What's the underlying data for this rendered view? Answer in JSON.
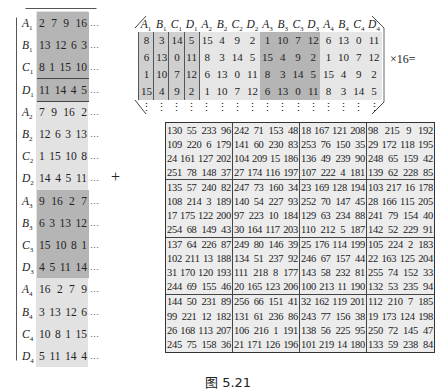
{
  "left_matrix": {
    "rows": [
      {
        "label": "A",
        "sub": "1",
        "values": [
          "2",
          "7",
          "9",
          "16"
        ],
        "dots": "…",
        "shade": "dark",
        "sep": true
      },
      {
        "label": "B",
        "sub": "1",
        "values": [
          "13",
          "12",
          "6",
          "3"
        ],
        "dots": "…",
        "shade": "dark",
        "sep": true
      },
      {
        "label": "C",
        "sub": "1",
        "values": [
          "8",
          "1",
          "15",
          "10"
        ],
        "dots": "…",
        "shade": "dark",
        "sep": true
      },
      {
        "label": "D",
        "sub": "1",
        "values": [
          "11",
          "14",
          "4",
          "5"
        ],
        "dots": "…",
        "shade": "dark",
        "sep": true
      },
      {
        "label": "A",
        "sub": "2",
        "values": [
          "7",
          "9",
          "16",
          "2"
        ],
        "dots": "…",
        "shade": "light",
        "sep": false
      },
      {
        "label": "B",
        "sub": "2",
        "values": [
          "12",
          "6",
          "3",
          "13"
        ],
        "dots": "…",
        "shade": "light",
        "sep": false
      },
      {
        "label": "C",
        "sub": "2",
        "values": [
          "1",
          "15",
          "10",
          "8"
        ],
        "dots": "…",
        "shade": "light",
        "sep": false
      },
      {
        "label": "D",
        "sub": "2",
        "values": [
          "14",
          "4",
          "5",
          "11"
        ],
        "dots": "…",
        "shade": "light",
        "sep": false
      },
      {
        "label": "A",
        "sub": "3",
        "values": [
          "9",
          "16",
          "2",
          "7"
        ],
        "dots": "…",
        "shade": "dark",
        "sep": false
      },
      {
        "label": "B",
        "sub": "3",
        "values": [
          "6",
          "3",
          "13",
          "12"
        ],
        "dots": "…",
        "shade": "dark",
        "sep": false
      },
      {
        "label": "C",
        "sub": "3",
        "values": [
          "15",
          "10",
          "8",
          "1"
        ],
        "dots": "…",
        "shade": "dark",
        "sep": false
      },
      {
        "label": "D",
        "sub": "3",
        "values": [
          "4",
          "5",
          "11",
          "14"
        ],
        "dots": "…",
        "shade": "dark",
        "sep": false
      },
      {
        "label": "A",
        "sub": "4",
        "values": [
          "16",
          "2",
          "7",
          "9"
        ],
        "dots": "…",
        "shade": "light",
        "sep": false
      },
      {
        "label": "B",
        "sub": "4",
        "values": [
          "3",
          "13",
          "12",
          "6"
        ],
        "dots": "…",
        "shade": "light",
        "sep": false
      },
      {
        "label": "C",
        "sub": "4",
        "values": [
          "10",
          "8",
          "1",
          "15"
        ],
        "dots": "…",
        "shade": "light",
        "sep": false
      },
      {
        "label": "D",
        "sub": "4",
        "values": [
          "5",
          "11",
          "14",
          "4"
        ],
        "dots": "…",
        "shade": "light",
        "sep": false
      }
    ]
  },
  "operator_plus": "+",
  "top_matrix": {
    "columns": [
      {
        "label": "A",
        "sub": "1",
        "values": [
          "8",
          "6",
          "1",
          "15"
        ],
        "shade": "mid"
      },
      {
        "label": "B",
        "sub": "1",
        "values": [
          "3",
          "13",
          "10",
          "4"
        ],
        "shade": "mid"
      },
      {
        "label": "C",
        "sub": "1",
        "values": [
          "14",
          "0",
          "7",
          "9"
        ],
        "shade": "mid"
      },
      {
        "label": "D",
        "sub": "1",
        "values": [
          "5",
          "11",
          "12",
          "2"
        ],
        "shade": "mid"
      },
      {
        "label": "A",
        "sub": "2",
        "values": [
          "15",
          "8",
          "6",
          "1"
        ],
        "shade": "light"
      },
      {
        "label": "B",
        "sub": "2",
        "values": [
          "4",
          "3",
          "13",
          "10"
        ],
        "shade": "light"
      },
      {
        "label": "C",
        "sub": "2",
        "values": [
          "9",
          "14",
          "0",
          "7"
        ],
        "shade": "light"
      },
      {
        "label": "D",
        "sub": "2",
        "values": [
          "2",
          "5",
          "11",
          "12"
        ],
        "shade": "light"
      },
      {
        "label": "A",
        "sub": "3",
        "values": [
          "1",
          "15",
          "8",
          "6"
        ],
        "shade": "dark"
      },
      {
        "label": "B",
        "sub": "3",
        "values": [
          "10",
          "4",
          "3",
          "13"
        ],
        "shade": "dark"
      },
      {
        "label": "C",
        "sub": "3",
        "values": [
          "7",
          "9",
          "14",
          "0"
        ],
        "shade": "dark"
      },
      {
        "label": "D",
        "sub": "3",
        "values": [
          "12",
          "2",
          "5",
          "11"
        ],
        "shade": "dark"
      },
      {
        "label": "A",
        "sub": "4",
        "values": [
          "6",
          "1",
          "15",
          "8"
        ],
        "shade": "light"
      },
      {
        "label": "B",
        "sub": "4",
        "values": [
          "13",
          "10",
          "4",
          "3"
        ],
        "shade": "light"
      },
      {
        "label": "C",
        "sub": "4",
        "values": [
          "0",
          "7",
          "9",
          "14"
        ],
        "shade": "light"
      },
      {
        "label": "D",
        "sub": "4",
        "values": [
          "11",
          "12",
          "2",
          "5"
        ],
        "shade": "light"
      }
    ],
    "vdots": "⋮"
  },
  "operator_times": "×16=",
  "result_grid": {
    "blocks": [
      [
        [
          [
            "130",
            "55",
            "233",
            "96"
          ],
          [
            "109",
            "220",
            "6",
            "179"
          ],
          [
            "24",
            "161",
            "127",
            "202"
          ],
          [
            "251",
            "78",
            "148",
            "37"
          ]
        ],
        [
          [
            "242",
            "71",
            "153",
            "48"
          ],
          [
            "141",
            "60",
            "230",
            "83"
          ],
          [
            "104",
            "209",
            "15",
            "186"
          ],
          [
            "27",
            "174",
            "116",
            "197"
          ]
        ],
        [
          [
            "18",
            "167",
            "121",
            "208"
          ],
          [
            "253",
            "76",
            "150",
            "35"
          ],
          [
            "136",
            "49",
            "239",
            "90"
          ],
          [
            "107",
            "222",
            "4",
            "181"
          ]
        ],
        [
          [
            "98",
            "215",
            "9",
            "192"
          ],
          [
            "29",
            "172",
            "118",
            "195"
          ],
          [
            "248",
            "65",
            "159",
            "42"
          ],
          [
            "139",
            "62",
            "228",
            "85"
          ]
        ]
      ],
      [
        [
          [
            "135",
            "57",
            "240",
            "82"
          ],
          [
            "108",
            "214",
            "3",
            "189"
          ],
          [
            "17",
            "175",
            "122",
            "200"
          ],
          [
            "254",
            "68",
            "149",
            "43"
          ]
        ],
        [
          [
            "247",
            "73",
            "160",
            "34"
          ],
          [
            "140",
            "54",
            "227",
            "93"
          ],
          [
            "97",
            "223",
            "10",
            "184"
          ],
          [
            "30",
            "164",
            "117",
            "203"
          ]
        ],
        [
          [
            "23",
            "169",
            "128",
            "194"
          ],
          [
            "252",
            "70",
            "147",
            "45"
          ],
          [
            "129",
            "63",
            "234",
            "88"
          ],
          [
            "110",
            "212",
            "5",
            "187"
          ]
        ],
        [
          [
            "103",
            "217",
            "16",
            "178"
          ],
          [
            "28",
            "166",
            "115",
            "205"
          ],
          [
            "241",
            "79",
            "154",
            "40"
          ],
          [
            "142",
            "52",
            "229",
            "91"
          ]
        ]
      ],
      [
        [
          [
            "137",
            "64",
            "226",
            "87"
          ],
          [
            "102",
            "211",
            "13",
            "188"
          ],
          [
            "31",
            "170",
            "120",
            "193"
          ],
          [
            "244",
            "69",
            "155",
            "46"
          ]
        ],
        [
          [
            "249",
            "80",
            "146",
            "39"
          ],
          [
            "134",
            "51",
            "237",
            "92"
          ],
          [
            "111",
            "218",
            "8",
            "177"
          ],
          [
            "20",
            "165",
            "123",
            "206"
          ]
        ],
        [
          [
            "25",
            "176",
            "114",
            "199"
          ],
          [
            "246",
            "67",
            "157",
            "44"
          ],
          [
            "143",
            "58",
            "232",
            "81"
          ],
          [
            "100",
            "213",
            "11",
            "190"
          ]
        ],
        [
          [
            "105",
            "224",
            "2",
            "183"
          ],
          [
            "22",
            "163",
            "125",
            "204"
          ],
          [
            "255",
            "74",
            "152",
            "33"
          ],
          [
            "132",
            "53",
            "235",
            "94"
          ]
        ]
      ],
      [
        [
          [
            "144",
            "50",
            "231",
            "89"
          ],
          [
            "99",
            "221",
            "12",
            "182"
          ],
          [
            "26",
            "168",
            "113",
            "207"
          ],
          [
            "245",
            "75",
            "158",
            "36"
          ]
        ],
        [
          [
            "256",
            "66",
            "151",
            "41"
          ],
          [
            "131",
            "61",
            "236",
            "86"
          ],
          [
            "106",
            "216",
            "1",
            "191"
          ],
          [
            "21",
            "171",
            "126",
            "196"
          ]
        ],
        [
          [
            "32",
            "162",
            "119",
            "201"
          ],
          [
            "243",
            "77",
            "156",
            "38"
          ],
          [
            "138",
            "56",
            "225",
            "95"
          ],
          [
            "101",
            "219",
            "14",
            "180"
          ]
        ],
        [
          [
            "112",
            "210",
            "7",
            "185"
          ],
          [
            "19",
            "173",
            "124",
            "198"
          ],
          [
            "250",
            "72",
            "145",
            "47"
          ],
          [
            "133",
            "59",
            "238",
            "84"
          ]
        ]
      ]
    ]
  },
  "caption": "图 5.21",
  "colors": {
    "dark": "#b5b5b5",
    "mid": "#cfcfcf",
    "light": "#e6e6e6",
    "grid_bg": "#ececec"
  }
}
